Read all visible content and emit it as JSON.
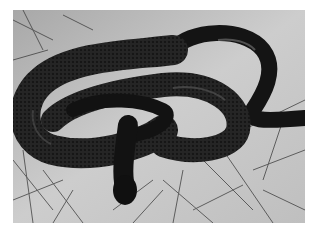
{
  "image": {
    "subject": "Black snake coiled on cracked dry soil with dry grass",
    "style": "grayscale photograph",
    "caption_fragment": ""
  },
  "colors": {
    "background": "#ffffff",
    "ground_light": "#cfcfcf",
    "ground_mid": "#a9a9a9",
    "grass_dark": "#3a3a3a",
    "snake_body": "#141414",
    "snake_highlight": "#5a5a5a"
  }
}
